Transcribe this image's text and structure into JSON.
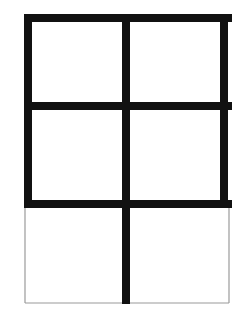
{
  "figure": {
    "kind": "line-drawing",
    "columns": 2,
    "rows": 3,
    "background_color": "#ffffff",
    "thick_stroke_color": "#111111",
    "thin_stroke_color": "#9a9a9a",
    "thick_stroke_width": "8",
    "thin_stroke_width": "1.2",
    "bounds": {
      "left": "28",
      "right": "228",
      "top": "18",
      "bottom": "303"
    },
    "guides": {
      "center_x": "126",
      "divider_y_1": "106",
      "divider_y_2": "204"
    },
    "cells": [
      {
        "name": "cell-row1-col1",
        "border_weight": "thick",
        "fill": "#ffffff"
      },
      {
        "name": "cell-row1-col2",
        "border_weight": "thick",
        "fill": "#ffffff"
      },
      {
        "name": "cell-row2-col1",
        "border_weight": "thick",
        "fill": "#ffffff"
      },
      {
        "name": "cell-row2-col2",
        "border_weight": "thick",
        "fill": "#ffffff"
      },
      {
        "name": "cell-row3-col1",
        "border_weight": "thin",
        "fill": "#ffffff"
      },
      {
        "name": "cell-row3-col2",
        "border_weight": "thin",
        "fill": "#ffffff"
      }
    ],
    "segments": [
      {
        "name": "outer-top-edge",
        "weight": "thick",
        "x1": "24",
        "y1": "18",
        "x2": "232",
        "y2": "18"
      },
      {
        "name": "outer-left-edge-upper",
        "weight": "thick",
        "x1": "28",
        "y1": "14",
        "x2": "28",
        "y2": "208"
      },
      {
        "name": "outer-right-edge-upper",
        "weight": "thick",
        "x1": "224",
        "y1": "14",
        "x2": "224",
        "y2": "208"
      },
      {
        "name": "horizontal-divider-1",
        "weight": "thick",
        "x1": "24",
        "y1": "106",
        "x2": "232",
        "y2": "106"
      },
      {
        "name": "horizontal-divider-2",
        "weight": "thick",
        "x1": "24",
        "y1": "204",
        "x2": "232",
        "y2": "204"
      },
      {
        "name": "vertical-center-divider",
        "weight": "thick",
        "x1": "126",
        "y1": "14",
        "x2": "126",
        "y2": "304"
      },
      {
        "name": "outer-left-edge-lower",
        "weight": "thin",
        "x1": "25",
        "y1": "206",
        "x2": "25",
        "y2": "303"
      },
      {
        "name": "outer-right-edge-lower",
        "weight": "thin",
        "x1": "229",
        "y1": "206",
        "x2": "229",
        "y2": "303"
      },
      {
        "name": "outer-bottom-edge",
        "weight": "thin",
        "x1": "25",
        "y1": "303",
        "x2": "229",
        "y2": "303"
      }
    ]
  }
}
